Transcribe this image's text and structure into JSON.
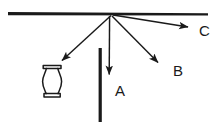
{
  "figure": {
    "background_color": "#ffffff",
    "stroke_color": "#1a1a1a",
    "vertex": {
      "x": 111,
      "y": 14
    },
    "ceiling_bar": {
      "name": "horizontal-support-bar",
      "x1": 8,
      "y1": 13.2,
      "x2": 208,
      "y2": 14.2,
      "thickness": 3.4
    },
    "vertical_post": {
      "name": "vertical-post",
      "x": 100,
      "y_top": 48,
      "y_bottom": 122,
      "thickness": 3.2
    },
    "vase": {
      "name": "vase-object",
      "x_left": 42,
      "x_right": 62,
      "y_top": 65,
      "y_bottom": 97
    },
    "vectors": [
      {
        "name": "vector-to-vase",
        "label": "",
        "x1": 111,
        "y1": 15,
        "x2": 59,
        "y2": 63
      },
      {
        "name": "vector-a",
        "label": "A",
        "x1": 110,
        "y1": 16,
        "x2": 109,
        "y2": 79,
        "label_x": 115,
        "label_y": 96
      },
      {
        "name": "vector-b",
        "label": "B",
        "x1": 112,
        "y1": 16,
        "x2": 161,
        "y2": 66,
        "label_x": 173,
        "label_y": 76
      },
      {
        "name": "vector-c",
        "label": "C",
        "x1": 113,
        "y1": 15,
        "x2": 192,
        "y2": 28,
        "label_x": 199,
        "label_y": 36
      }
    ],
    "labels": {
      "a": "A",
      "b": "B",
      "c": "C"
    }
  }
}
